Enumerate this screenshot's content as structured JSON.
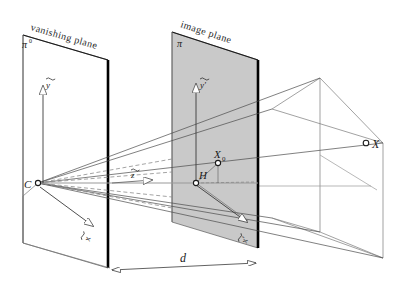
{
  "figure": {
    "title_vanishing_plane": "vanishing plane",
    "title_image_plane": "image plane",
    "labels": {
      "pi_zero": "π",
      "pi_zero_sup": "0",
      "pi": "π",
      "camera_center": "C",
      "principal_point": "H",
      "image_point": "X",
      "image_point_sub": "0",
      "world_point": "X",
      "distance": "d",
      "vec_y": "y",
      "vec_z": "z",
      "vec_x": "x",
      "vec_y_prime": "y′",
      "vec_x_prime": "x′"
    },
    "colors": {
      "plane_fill": "#c9c9c9",
      "plane_edge_thick": "#000000",
      "wire_line": "#6e6e6e",
      "ray_line": "#4a4a4a",
      "dashed_ray": "#8a8a8a",
      "text": "#1a1a1a",
      "background": "#ffffff"
    }
  }
}
